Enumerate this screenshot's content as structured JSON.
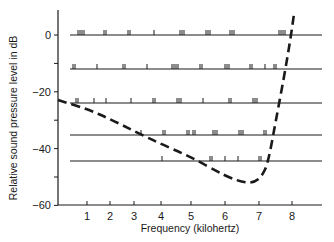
{
  "chart_data": {
    "type": "line",
    "title": "",
    "xlabel": "Frequency (kilohertz)",
    "ylabel": "Relative sound pressure level in dB",
    "xlim": [
      0,
      8.7
    ],
    "ylim": [
      -60,
      10
    ],
    "x_ticks": [
      1,
      2,
      3,
      4,
      5,
      6,
      7,
      8
    ],
    "x_tick_labels": [
      "1",
      "2",
      "3",
      "4",
      "5",
      "6",
      "7",
      "8"
    ],
    "x_tick_pixels": [
      87,
      110,
      134,
      161,
      191,
      225,
      259,
      292
    ],
    "y_ticks": [
      0,
      -10,
      -20,
      -30,
      -40,
      -50,
      -60
    ],
    "y_tick_labels": [
      "0",
      "",
      "−20",
      "",
      "−40",
      "",
      "−60"
    ],
    "grid": false,
    "legend": null,
    "series": [
      {
        "name": "Threshold curve (dashed)",
        "style": "dashed",
        "x_khz": [
          0,
          1,
          2,
          3,
          4,
          5,
          6,
          6.6,
          7.0,
          7.2,
          7.4,
          7.6,
          7.8,
          8.0
        ],
        "y_db": [
          -23,
          -26.5,
          -30,
          -34,
          -39,
          -44,
          -49,
          -52,
          -51,
          -45,
          -30,
          -15,
          -2,
          8
        ]
      }
    ],
    "spectral_rows": [
      {
        "level_db": 0,
        "line_y": 35,
        "tick_x": [
          78,
          80,
          82,
          84,
          104,
          106,
          128,
          130,
          154,
          180,
          182,
          184,
          206,
          208,
          210,
          230,
          232,
          234,
          279,
          281,
          283,
          285
        ]
      },
      {
        "level_db": -11,
        "line_y": 69,
        "tick_x": [
          73,
          75,
          97,
          123,
          125,
          147,
          172,
          174,
          176,
          178,
          200,
          202,
          225,
          227,
          229,
          250,
          252,
          265,
          274,
          276
        ]
      },
      {
        "level_db": -23.5,
        "line_y": 103,
        "tick_x": [
          76,
          78,
          94,
          106,
          131,
          153,
          155,
          177,
          179,
          181,
          203,
          229,
          231,
          253,
          255,
          257
        ]
      },
      {
        "level_db": -35,
        "line_y": 135,
        "tick_x": [
          141,
          163,
          165,
          187,
          189,
          193,
          195,
          213,
          215,
          217,
          239,
          241,
          243,
          264,
          266
        ]
      },
      {
        "level_db": -44,
        "line_y": 161,
        "tick_x": [
          162,
          210,
          212,
          225,
          238,
          259,
          261
        ]
      }
    ]
  },
  "layout": {
    "axis_x0": 58,
    "axis_x1": 322,
    "axis_y0": 205,
    "y0_px": 35,
    "px_per_db": 2.84,
    "row_x0": 70,
    "row_x1": 322,
    "curve_points_px": [
      [
        58,
        100
      ],
      [
        87,
        109
      ],
      [
        110,
        119
      ],
      [
        134,
        131
      ],
      [
        161,
        144
      ],
      [
        191,
        157
      ],
      [
        225,
        176
      ],
      [
        245,
        183
      ],
      [
        255,
        182
      ],
      [
        262,
        176
      ],
      [
        268,
        163
      ],
      [
        276,
        120
      ],
      [
        284,
        77
      ],
      [
        290,
        42
      ],
      [
        294,
        14
      ]
    ]
  },
  "colors": {
    "ink": "#1a1a1a",
    "background": "#ffffff"
  }
}
